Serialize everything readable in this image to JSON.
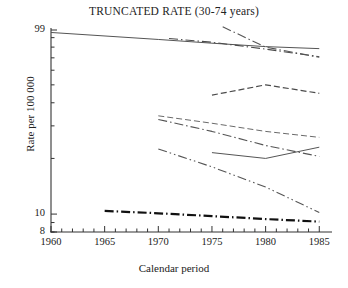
{
  "chart_data": {
    "type": "line",
    "title": "TRUNCATED RATE (30-74 years)",
    "xlabel": "Calendar period",
    "ylabel": "Rate per 100 000",
    "yscale": "log",
    "ylim": [
      8,
      99
    ],
    "xlim": [
      1960,
      1986
    ],
    "grid": false,
    "legend": "none",
    "ytick_labels": [
      "99",
      "10",
      "8"
    ],
    "ytick_values": [
      99,
      10,
      8
    ],
    "xtick_labels": [
      "1960",
      "1965",
      "1970",
      "1975",
      "1980",
      "1985"
    ],
    "xtick_values": [
      1960,
      1965,
      1970,
      1975,
      1980,
      1985
    ],
    "x_minor_tick_step": 1,
    "series": [
      {
        "name": "series-1-top-solid",
        "style": "solid",
        "width": 1.0,
        "color": "#555555",
        "x": [
          1960,
          1970,
          1975,
          1980,
          1985
        ],
        "y": [
          96.0,
          88.0,
          84.0,
          80.5,
          78.5
        ]
      },
      {
        "name": "series-2-upper-dashdot",
        "style": "dashdot",
        "width": 1.1,
        "color": "#4a4a4a",
        "x": [
          1971,
          1975,
          1980,
          1985
        ],
        "y": [
          89.0,
          85.0,
          78.0,
          71.0
        ]
      },
      {
        "name": "series-3-steep-dashdot",
        "style": "dashdot",
        "width": 1.1,
        "color": "#555555",
        "x": [
          1976,
          1980,
          1985
        ],
        "y": [
          103.0,
          80.0,
          70.5
        ]
      },
      {
        "name": "series-4-peak-dashed",
        "style": "dashed",
        "width": 1.2,
        "color": "#4a4a4a",
        "x": [
          1975,
          1980,
          1985
        ],
        "y": [
          44.0,
          50.0,
          45.0
        ]
      },
      {
        "name": "series-5-mid-dashed",
        "style": "dashed",
        "width": 1.0,
        "color": "#6a6a6a",
        "x": [
          1970,
          1975,
          1980,
          1985
        ],
        "y": [
          34.0,
          31.0,
          28.0,
          26.0
        ]
      },
      {
        "name": "series-6-mid-dashdot",
        "style": "dashdot",
        "width": 1.1,
        "color": "#555555",
        "x": [
          1970,
          1975,
          1980,
          1985
        ],
        "y": [
          32.5,
          28.0,
          23.5,
          20.5
        ]
      },
      {
        "name": "series-7-v-solid",
        "style": "solid",
        "width": 1.0,
        "color": "#555555",
        "x": [
          1975,
          1980,
          1985
        ],
        "y": [
          21.5,
          20.0,
          23.0
        ]
      },
      {
        "name": "series-8-steep-dashdotdot",
        "style": "dashdotdot",
        "width": 1.1,
        "color": "#555555",
        "x": [
          1970,
          1975,
          1980,
          1985
        ],
        "y": [
          22.5,
          18.0,
          14.0,
          10.2
        ]
      },
      {
        "name": "series-9-bottom-thick-dashdot",
        "style": "dashdot",
        "width": 2.2,
        "color": "#111111",
        "x": [
          1965,
          1970,
          1975,
          1980,
          1985
        ],
        "y": [
          10.4,
          10.1,
          9.75,
          9.4,
          9.1
        ]
      }
    ]
  },
  "axes": {
    "x_tick_labels": [
      "1960",
      "1965",
      "1970",
      "1975",
      "1980",
      "1985"
    ],
    "y_tick_labels": [
      "99",
      "10",
      "8"
    ]
  },
  "colors": {
    "axis": "#333333",
    "text": "#222222",
    "background": "#ffffff"
  }
}
